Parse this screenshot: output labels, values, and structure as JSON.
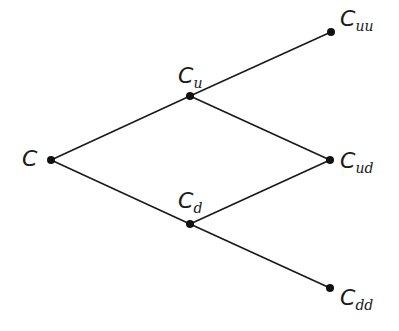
{
  "diagram": {
    "type": "binomial-tree",
    "nodes": [
      {
        "id": "C",
        "base": "C",
        "sub": "",
        "x": 51,
        "y": 160
      },
      {
        "id": "Cu",
        "base": "C",
        "sub": "u",
        "x": 190,
        "y": 96
      },
      {
        "id": "Cd",
        "base": "C",
        "sub": "d",
        "x": 190,
        "y": 224
      },
      {
        "id": "Cuu",
        "base": "C",
        "sub": "uu",
        "x": 331,
        "y": 32
      },
      {
        "id": "Cud",
        "base": "C",
        "sub": "ud",
        "x": 330,
        "y": 160
      },
      {
        "id": "Cdd",
        "base": "C",
        "sub": "dd",
        "x": 330,
        "y": 288
      }
    ],
    "edges": [
      [
        "C",
        "Cu"
      ],
      [
        "C",
        "Cd"
      ],
      [
        "Cu",
        "Cuu"
      ],
      [
        "Cu",
        "Cud"
      ],
      [
        "Cd",
        "Cud"
      ],
      [
        "Cd",
        "Cdd"
      ]
    ],
    "colors": {
      "line": "#1a1a1a",
      "node": "#111111",
      "background": "#ffffff"
    }
  }
}
